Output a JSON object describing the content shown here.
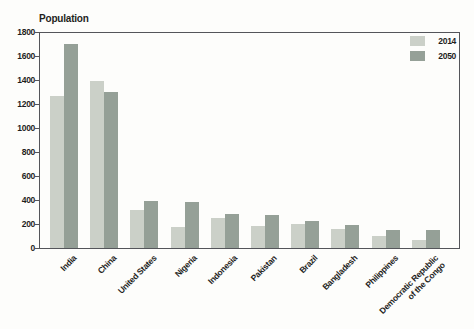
{
  "chart_data": {
    "type": "bar",
    "title": "Population",
    "categories": [
      "India",
      "China",
      "United States",
      "Nigeria",
      "Indonesia",
      "Pakistan",
      "Brazil",
      "Bangladesh",
      "Philippines",
      "Democratic Republic\nof the Congo"
    ],
    "series": [
      {
        "name": "2014",
        "color": "#cbd0c8",
        "values": [
          1270,
          1390,
          320,
          175,
          250,
          185,
          200,
          158,
          100,
          70
        ]
      },
      {
        "name": "2050",
        "color": "#95a097",
        "values": [
          1700,
          1300,
          395,
          390,
          290,
          280,
          230,
          195,
          150,
          150
        ]
      }
    ],
    "xlabel": "",
    "ylabel": "",
    "ylim": [
      0,
      1800
    ],
    "ytick_step": 200,
    "ytick_labels": [
      "0",
      "200",
      "400",
      "600",
      "800",
      "1000",
      "1200",
      "1400",
      "1600",
      "1800"
    ],
    "grid": false,
    "legend_position": "top-right-inside",
    "axis_color": "#54555a",
    "text_color": "#1f1f1d",
    "background": "#fdfdfb"
  }
}
